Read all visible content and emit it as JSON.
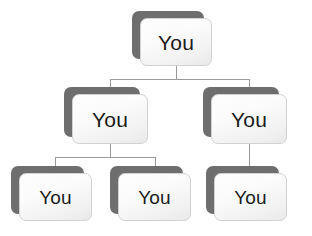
{
  "diagram": {
    "type": "org-tree",
    "background_color": "#ffffff",
    "canvas": {
      "width": 312,
      "height": 236
    },
    "style": {
      "shadow_card_color": "#6e6e6e",
      "face_card_top_color": "#fefefe",
      "face_card_bottom_color": "#e9e9e9",
      "face_border_color": "#d2d2d2",
      "label_text_color": "#1b1b1b",
      "connector_color": "#9a9a9a",
      "connector_width": 1,
      "card_corner_radius": 7,
      "shadow_offset_x": -8,
      "shadow_offset_y": -7
    },
    "nodes": [
      {
        "id": "root",
        "label": "You",
        "level": 1,
        "x": 132,
        "y": 11,
        "width": 72,
        "height": 48
      },
      {
        "id": "mid-left",
        "label": "You",
        "level": 2,
        "x": 64,
        "y": 87,
        "width": 76,
        "height": 50
      },
      {
        "id": "mid-right",
        "label": "You",
        "level": 2,
        "x": 203,
        "y": 87,
        "width": 76,
        "height": 50
      },
      {
        "id": "leaf-1",
        "label": "You",
        "level": 3,
        "x": 11,
        "y": 166,
        "width": 73,
        "height": 48
      },
      {
        "id": "leaf-2",
        "label": "You",
        "level": 3,
        "x": 110,
        "y": 166,
        "width": 73,
        "height": 48
      },
      {
        "id": "leaf-3",
        "label": "You",
        "level": 3,
        "x": 206,
        "y": 166,
        "width": 73,
        "height": 48
      }
    ],
    "edges": [
      {
        "from": "root",
        "to": "mid-left"
      },
      {
        "from": "root",
        "to": "mid-right"
      },
      {
        "from": "mid-left",
        "to": "leaf-1"
      },
      {
        "from": "mid-left",
        "to": "leaf-2"
      },
      {
        "from": "mid-right",
        "to": "leaf-3"
      }
    ]
  }
}
